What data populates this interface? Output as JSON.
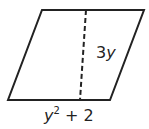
{
  "diagram": {
    "shape": "parallelogram",
    "stroke_color": "#222222",
    "height_label": {
      "base": "3",
      "var": "y"
    },
    "base_label": {
      "var": "y",
      "exponent": "2",
      "rest": " + 2"
    },
    "height_line_style": "dashed"
  }
}
